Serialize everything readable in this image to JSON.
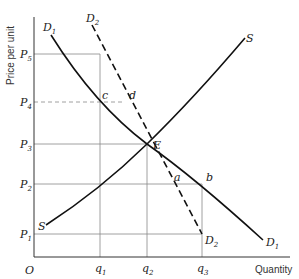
{
  "diagram": {
    "type": "supply-demand",
    "axes": {
      "y_label": "Price per unit",
      "x_label": "Quantity",
      "origin_label": "O"
    },
    "price_levels": [
      {
        "id": "P1",
        "base": "P",
        "sub": "1"
      },
      {
        "id": "P2",
        "base": "P",
        "sub": "2"
      },
      {
        "id": "P3",
        "base": "P",
        "sub": "3"
      },
      {
        "id": "P4",
        "base": "P",
        "sub": "4"
      },
      {
        "id": "P5",
        "base": "P",
        "sub": "5"
      }
    ],
    "quantity_levels": [
      {
        "id": "q1",
        "base": "q",
        "sub": "1"
      },
      {
        "id": "q2",
        "base": "q",
        "sub": "2"
      },
      {
        "id": "q3",
        "base": "q",
        "sub": "3"
      }
    ],
    "curves": {
      "D1": {
        "base": "D",
        "sub": "1",
        "style": "solid"
      },
      "D2": {
        "base": "D",
        "sub": "2",
        "style": "dashed"
      },
      "S": {
        "label": "S",
        "style": "solid"
      }
    },
    "points": {
      "E": "E",
      "a": "a",
      "b": "b",
      "c": "c",
      "d": "d"
    }
  }
}
